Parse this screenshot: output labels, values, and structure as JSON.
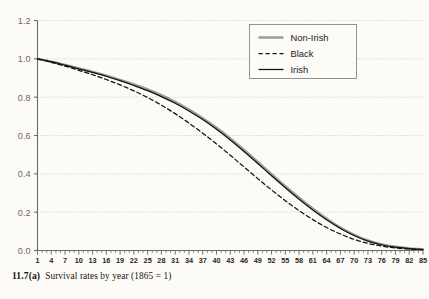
{
  "figure": {
    "caption_number": "11.7(a)",
    "caption_text": "Survival rates by year (1865 = 1)",
    "background_color": "#fcfbf7"
  },
  "legend": {
    "position": "top-right",
    "entries": [
      {
        "label": "Non-Irish",
        "color": "#9c9c96",
        "style": "solid-thick"
      },
      {
        "label": "Black",
        "color": "#15120e",
        "style": "dashed"
      },
      {
        "label": "Irish",
        "color": "#15120e",
        "style": "solid-thin"
      }
    ]
  },
  "chart_data": {
    "type": "line",
    "title": "Survival rates by year (1865 = 1)",
    "xlabel": "",
    "ylabel": "",
    "xlim": [
      1,
      85
    ],
    "ylim": [
      0.0,
      1.2
    ],
    "grid": true,
    "y_ticks": [
      "0.0",
      "0.2",
      "0.4",
      "0.6",
      "0.8",
      "1.0",
      "1.2"
    ],
    "y_tick_values": [
      0.0,
      0.2,
      0.4,
      0.6,
      0.8,
      1.0,
      1.2
    ],
    "x_ticks": [
      "1",
      "4",
      "7",
      "10",
      "13",
      "16",
      "19",
      "22",
      "25",
      "28",
      "31",
      "34",
      "37",
      "40",
      "43",
      "46",
      "49",
      "52",
      "55",
      "58",
      "61",
      "64",
      "67",
      "70",
      "73",
      "76",
      "79",
      "82",
      "85"
    ],
    "x_tick_values": [
      1,
      4,
      7,
      10,
      13,
      16,
      19,
      22,
      25,
      28,
      31,
      34,
      37,
      40,
      43,
      46,
      49,
      52,
      55,
      58,
      61,
      64,
      67,
      70,
      73,
      76,
      79,
      82,
      85
    ],
    "x": [
      1,
      4,
      7,
      10,
      13,
      16,
      19,
      22,
      25,
      28,
      31,
      34,
      37,
      40,
      43,
      46,
      49,
      52,
      55,
      58,
      61,
      64,
      67,
      70,
      73,
      76,
      79,
      82,
      85
    ],
    "series": [
      {
        "name": "Non-Irish",
        "color": "#9c9c96",
        "style": "solid-thick",
        "values": [
          1.0,
          0.985,
          0.968,
          0.95,
          0.932,
          0.912,
          0.89,
          0.866,
          0.84,
          0.81,
          0.775,
          0.735,
          0.69,
          0.64,
          0.585,
          0.525,
          0.462,
          0.398,
          0.335,
          0.275,
          0.218,
          0.166,
          0.12,
          0.082,
          0.052,
          0.032,
          0.019,
          0.011,
          0.006
        ]
      },
      {
        "name": "Black",
        "color": "#15120e",
        "style": "dashed",
        "values": [
          1.0,
          0.982,
          0.962,
          0.94,
          0.917,
          0.892,
          0.864,
          0.833,
          0.798,
          0.758,
          0.714,
          0.665,
          0.612,
          0.556,
          0.497,
          0.436,
          0.375,
          0.316,
          0.26,
          0.208,
          0.161,
          0.12,
          0.086,
          0.058,
          0.037,
          0.023,
          0.013,
          0.008,
          0.004
        ]
      },
      {
        "name": "Irish",
        "color": "#15120e",
        "style": "solid-thin",
        "values": [
          1.0,
          0.985,
          0.967,
          0.948,
          0.929,
          0.909,
          0.886,
          0.861,
          0.834,
          0.803,
          0.768,
          0.728,
          0.683,
          0.632,
          0.577,
          0.517,
          0.454,
          0.39,
          0.327,
          0.267,
          0.211,
          0.16,
          0.115,
          0.078,
          0.049,
          0.03,
          0.017,
          0.01,
          0.005
        ]
      }
    ]
  }
}
